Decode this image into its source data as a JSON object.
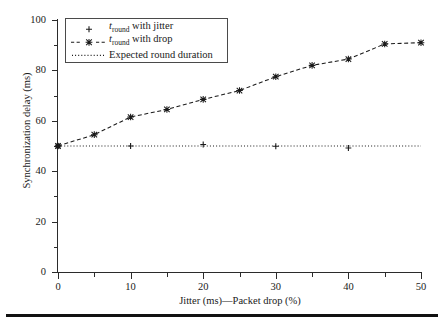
{
  "chart_data": {
    "type": "line",
    "title": "",
    "xlabel": "Jitter (ms)—Packet drop (%)",
    "ylabel": "Synchronization delay (ms)",
    "xlim": [
      0,
      50
    ],
    "ylim": [
      0,
      100
    ],
    "xticks": [
      0,
      10,
      20,
      30,
      40,
      50
    ],
    "xticklabels": [
      "0",
      "10",
      "20",
      "30",
      "40",
      "50"
    ],
    "xminorticks": [
      5,
      15,
      25,
      35,
      45
    ],
    "yticks": [
      0,
      20,
      40,
      60,
      80,
      100
    ],
    "yticklabels": [
      "0",
      "20",
      "40",
      "60",
      "80",
      "100"
    ],
    "yminorticks": [
      10,
      30,
      50,
      70,
      90
    ],
    "grid": false,
    "legend_position": "upper left",
    "series": [
      {
        "name": "t_round with jitter",
        "marker": "plus",
        "linestyle": "none",
        "color": "#1a1a1a",
        "x": [
          0,
          10,
          20,
          30,
          40
        ],
        "values": [
          50,
          50,
          50.6,
          49.9,
          49.2
        ]
      },
      {
        "name": "t_round with drop",
        "marker": "x-star",
        "linestyle": "dashed",
        "color": "#1a1a1a",
        "x": [
          0,
          5,
          10,
          15,
          20,
          25,
          30,
          35,
          40,
          45,
          50
        ],
        "values": [
          50,
          54.5,
          61.5,
          64.5,
          68.5,
          72,
          77.5,
          82,
          84.5,
          90.5,
          91
        ]
      },
      {
        "name": "Expected round duration",
        "marker": "none",
        "linestyle": "dotted",
        "color": "#1a1a1a",
        "x": [
          0,
          50
        ],
        "values": [
          50,
          50
        ]
      }
    ]
  },
  "legend": {
    "items": [
      {
        "prefix": "t",
        "sub": "round",
        "suffix": " with jitter",
        "key": "plus-marker"
      },
      {
        "prefix": "t",
        "sub": "round",
        "suffix": " with drop",
        "key": "dashed-x-marker"
      },
      {
        "prefix": "",
        "sub": "",
        "suffix": "Expected round duration",
        "key": "dotted-line"
      }
    ]
  },
  "colors": {
    "foreground": "#1a1a1a",
    "axis": "#2b2b2b",
    "legend_border": "#4a4a4a",
    "rule": "#111111",
    "background": "#ffffff"
  }
}
